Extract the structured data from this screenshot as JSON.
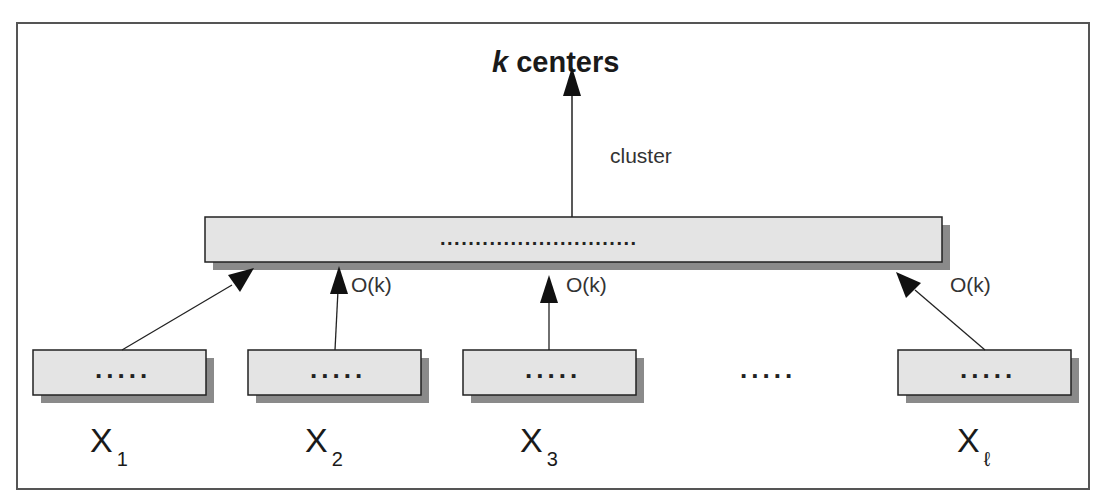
{
  "diagram": {
    "title": {
      "prefix": "k",
      "rest": " centers"
    },
    "top_edge_label": "cluster",
    "aggregator": {
      "content": "............................"
    },
    "edge_labels": [
      "O(k)",
      "O(k)",
      "O(k)"
    ],
    "middle_ellipsis": ".....",
    "nodes": [
      {
        "content": ".....",
        "var": "X",
        "sub": "1"
      },
      {
        "content": ".....",
        "var": "X",
        "sub": "2"
      },
      {
        "content": ".....",
        "var": "X",
        "sub": "3"
      },
      {
        "content": ".....",
        "var": "X",
        "sub": "ℓ"
      }
    ],
    "colors": {
      "box_fill": "#e4e4e4",
      "shadow": "#8a8a8a",
      "stroke": "#222222",
      "frame": "#555555"
    }
  }
}
